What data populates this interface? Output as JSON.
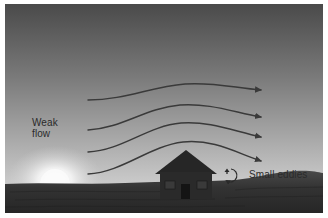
{
  "figure": {
    "labels": {
      "weak_flow_line1": "Weak",
      "weak_flow_line2": "flow",
      "small_eddies": "Small eddies"
    },
    "elements": {
      "airflow_arrows": 4,
      "building": "house",
      "eddy_symbol": "circular-arrow",
      "background": "sky-gradient-with-setting-sun",
      "ground": "dark-hills"
    },
    "colors": {
      "sky_top": "#4a4a4a",
      "sky_bottom": "#d4d4d4",
      "arrow": "#3a3a3a",
      "house": "#262626",
      "ground": "#2e2e2e",
      "text": "#2a2a2a",
      "sun_glow": "#ffffff"
    }
  }
}
